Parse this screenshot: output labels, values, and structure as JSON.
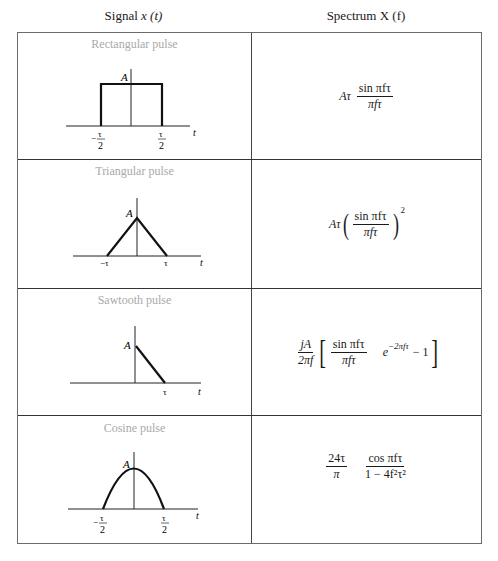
{
  "header": {
    "signal_label": "Signal",
    "signal_var": "x (t)",
    "spectrum_label": "Spectrum X (f)"
  },
  "rows": [
    {
      "title": "Rectangular pulse",
      "amplitude_label": "A",
      "axis_label": "t",
      "tick_left": "−τ/2",
      "tick_right": "τ/2",
      "tick_left_num": "τ",
      "tick_left_den": "2",
      "tick_right_num": "τ",
      "tick_right_den": "2",
      "spectrum": {
        "prefix": "Aτ",
        "numerator": "sin πfτ",
        "denominator": "πfτ"
      }
    },
    {
      "title": "Triangular pulse",
      "amplitude_label": "A",
      "axis_label": "t",
      "tick_left": "−τ",
      "tick_right": "τ",
      "spectrum": {
        "prefix": "Aτ",
        "numerator": "sin πfτ",
        "denominator": "πfτ",
        "exponent": "2"
      }
    },
    {
      "title": "Sawtooth pulse",
      "amplitude_label": "A",
      "axis_label": "t",
      "tick_right": "τ",
      "spectrum": {
        "prefix_numerator": "jA",
        "prefix_denominator": "2πf",
        "numerator": "sin πfτ",
        "denominator": "πfτ",
        "exp_base": "e",
        "exp_power": "−2πfτ",
        "tail": "− 1"
      }
    },
    {
      "title": "Cosine pulse",
      "amplitude_label": "A",
      "axis_label": "t",
      "tick_left": "−τ/2",
      "tick_right": "τ/2",
      "tick_left_num": "τ",
      "tick_left_den": "2",
      "tick_right_num": "τ",
      "tick_right_den": "2",
      "spectrum": {
        "prefix_numerator": "24τ",
        "prefix_denominator": "π",
        "numerator": "cos πfτ",
        "denominator": "1 − 4f²τ²"
      }
    }
  ]
}
